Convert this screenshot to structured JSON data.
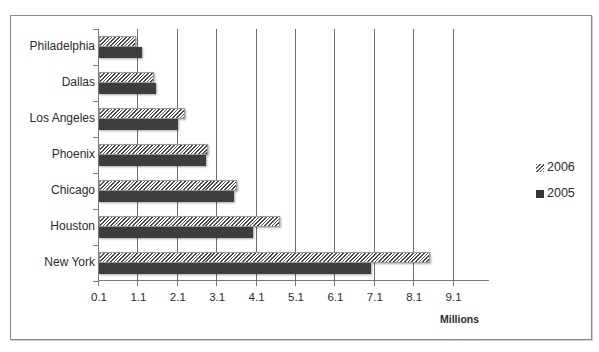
{
  "chart_data": {
    "type": "bar",
    "orientation": "horizontal",
    "title": "",
    "xlabel": "Millions",
    "ylabel": "",
    "categories": [
      "Philadelphia",
      "Dallas",
      "Los Angeles",
      "Phoenix",
      "Chicago",
      "Houston",
      "New York"
    ],
    "series": [
      {
        "name": "2006",
        "pattern": "diagonal-hatch",
        "values": [
          1.04,
          1.5,
          2.28,
          2.87,
          3.6,
          4.69,
          8.5
        ]
      },
      {
        "name": "2005",
        "pattern": "dense-dotted",
        "values": [
          1.19,
          1.55,
          2.1,
          2.82,
          3.53,
          4.01,
          7.0
        ]
      }
    ],
    "xlim": [
      0.1,
      10.0
    ],
    "x_ticks": [
      "0.1",
      "1.1",
      "2.1",
      "3.1",
      "4.1",
      "5.1",
      "6.1",
      "7.1",
      "8.1",
      "9.1"
    ],
    "grid": "vertical major gridlines",
    "legend": {
      "position": "right",
      "entries": [
        "2006",
        "2005"
      ]
    }
  },
  "axis": {
    "title": "Millions"
  },
  "legend": {
    "items": [
      {
        "label": "2006"
      },
      {
        "label": "2005"
      }
    ]
  },
  "colors": {
    "frame": "#8a8a8a",
    "gridline": "#6e6e6e",
    "text": "#2b2b2b",
    "bar_2005": "#6a6a6a",
    "bar_2006_hatch": "#4a4a4a"
  }
}
